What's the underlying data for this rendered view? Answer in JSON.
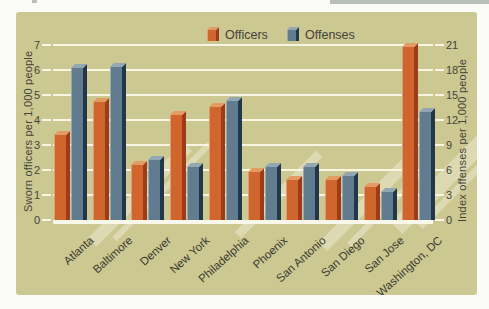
{
  "colors": {
    "panel": "#ccc891",
    "grid": "#f8f5e2",
    "baseline": "#faf8ea",
    "stripe": "rgba(248,246,230,0.4)",
    "officers": {
      "front": "#d0662e",
      "side": "#9c3c1b",
      "top": "#e39a63"
    },
    "offenses": {
      "front": "#617b8f",
      "side": "#22384a",
      "top": "#93a6b3"
    }
  },
  "legend": {
    "officers_label": "Officers",
    "offenses_label": "Offenses"
  },
  "chart_data": {
    "type": "bar",
    "title": "",
    "categories": [
      "Atlanta",
      "Baltimore",
      "Denver",
      "New York",
      "Philadelphia",
      "Phoenix",
      "San Antonio",
      "San Diego",
      "San Jose",
      "Washington, DC"
    ],
    "series": [
      {
        "name": "Officers",
        "axis": "left",
        "color_key": "officers",
        "values": [
          3.4,
          4.7,
          2.2,
          4.2,
          4.5,
          1.9,
          1.6,
          1.6,
          1.3,
          6.9
        ]
      },
      {
        "name": "Offenses",
        "axis": "right",
        "color_key": "offenses",
        "values": [
          18.2,
          18.4,
          7.2,
          6.4,
          14.3,
          6.4,
          6.3,
          5.3,
          3.4,
          13.0
        ]
      }
    ],
    "left_axis": {
      "label": "Sworn officers per 1,000 people",
      "range": [
        0,
        7
      ],
      "ticks": [
        0,
        1,
        2,
        3,
        4,
        5,
        6,
        7
      ]
    },
    "right_axis": {
      "label": "Index offenses per 1,000 people",
      "range": [
        0,
        21
      ],
      "ticks": [
        0,
        3,
        6,
        9,
        12,
        15,
        18,
        21
      ]
    },
    "grid": true,
    "legend_position": "top"
  }
}
